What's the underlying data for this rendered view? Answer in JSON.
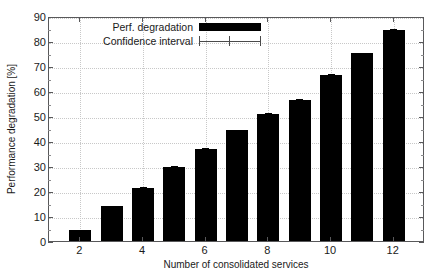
{
  "chart_data": {
    "type": "bar",
    "title": "",
    "xlabel": "Number of consolidated services",
    "ylabel": "Performance degradation [%]",
    "categories": [
      2,
      3,
      4,
      5,
      6,
      7,
      8,
      9,
      10,
      11,
      12
    ],
    "values": [
      4.5,
      14.0,
      21.3,
      29.8,
      37.0,
      44.5,
      50.7,
      56.5,
      66.5,
      75.3,
      84.5
    ],
    "errors": [
      0.9,
      0.8,
      1.0,
      0.9,
      0.9,
      0.9,
      1.2,
      1.3,
      1.1,
      0.9,
      1.3
    ],
    "series": [
      {
        "name": "Perf. degradation",
        "values": [
          4.5,
          14.0,
          21.3,
          29.8,
          37.0,
          44.5,
          50.7,
          56.5,
          66.5,
          75.3,
          84.5
        ]
      }
    ],
    "xlim": [
      1,
      13
    ],
    "ylim": [
      0,
      90
    ],
    "ytick_values": [
      0,
      10,
      20,
      30,
      40,
      50,
      60,
      70,
      80,
      90
    ],
    "ytick_labels": [
      "0",
      "10",
      "20",
      "30",
      "40",
      "50",
      "60",
      "70",
      "80",
      "90"
    ],
    "xtick_values": [
      2,
      4,
      6,
      8,
      10,
      12
    ],
    "xtick_labels": [
      "2",
      "4",
      "6",
      "8",
      "10",
      "12"
    ],
    "grid": true,
    "grid_style": "dotted",
    "legend_position": "top-left",
    "legend": [
      {
        "label": "Perf. degradation",
        "swatch": "filled-bar",
        "color": "#000000"
      },
      {
        "label": "Confidence interval",
        "swatch": "error-bar",
        "color": "#4a4a4a"
      }
    ],
    "colors": {
      "bar": "#000000",
      "error": "#000000",
      "grid": "#c8c8c8",
      "axis": "#58585a",
      "text": "#1a1a1a",
      "background": "#ffffff"
    }
  }
}
